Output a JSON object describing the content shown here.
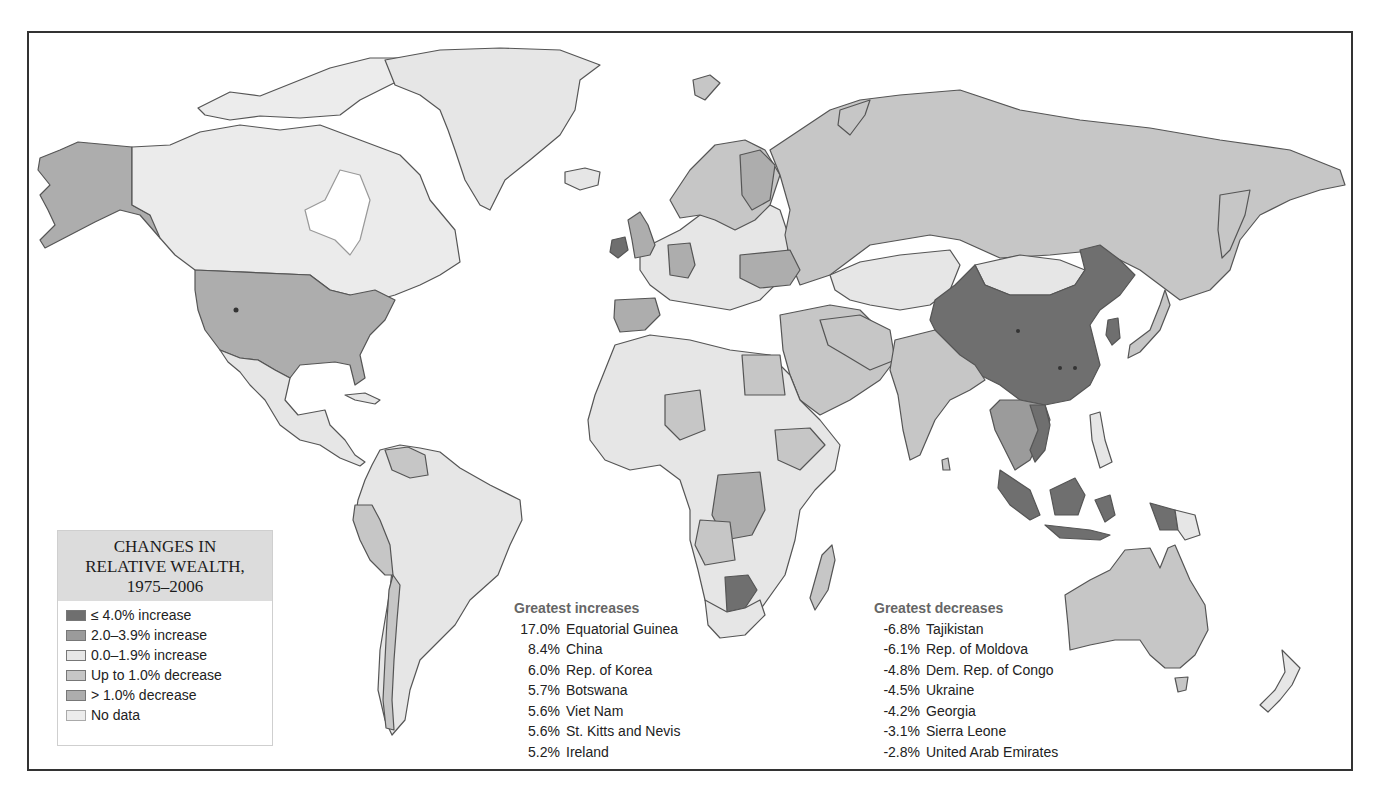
{
  "legend": {
    "title_lines": [
      "CHANGES IN",
      "RELATIVE WEALTH,",
      "1975–2006"
    ],
    "items": [
      {
        "label": "≤ 4.0% increase",
        "color": "#6f6f6f"
      },
      {
        "label": "2.0–3.9% increase",
        "color": "#9b9b9b"
      },
      {
        "label": "0.0–1.9% increase",
        "color": "#e6e6e6"
      },
      {
        "label": "Up to 1.0% decrease",
        "color": "#c6c6c6"
      },
      {
        "label": "> 1.0% decrease",
        "color": "#adadad"
      },
      {
        "label": "No data",
        "color": "#ececec"
      }
    ]
  },
  "increases": {
    "title": "Greatest increases",
    "rows": [
      {
        "value": "17.0%",
        "country": "Equatorial Guinea"
      },
      {
        "value": "8.4%",
        "country": "China"
      },
      {
        "value": "6.0%",
        "country": "Rep. of Korea"
      },
      {
        "value": "5.7%",
        "country": "Botswana"
      },
      {
        "value": "5.6%",
        "country": "Viet Nam"
      },
      {
        "value": "5.6%",
        "country": "St. Kitts and Nevis"
      },
      {
        "value": "5.2%",
        "country": "Ireland"
      }
    ]
  },
  "decreases": {
    "title": "Greatest decreases",
    "rows": [
      {
        "value": "-6.8%",
        "country": "Tajikistan"
      },
      {
        "value": "-6.1%",
        "country": "Rep. of Moldova"
      },
      {
        "value": "-4.8%",
        "country": "Dem. Rep. of Congo"
      },
      {
        "value": "-4.5%",
        "country": "Ukraine"
      },
      {
        "value": "-4.2%",
        "country": "Georgia"
      },
      {
        "value": "-3.1%",
        "country": "Sierra Leone"
      },
      {
        "value": "-2.8%",
        "country": "United Arab Emirates"
      }
    ]
  },
  "colors": {
    "border": "#555555",
    "frame": "#333333",
    "ocean": "#ffffff"
  }
}
